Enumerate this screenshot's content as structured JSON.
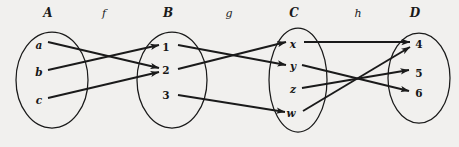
{
  "figure": {
    "background_color": "#f1f0ee",
    "ink_color": "#1a1a1a"
  },
  "sets": [
    {
      "id": "A",
      "label": "A",
      "cx": 52,
      "cy": 80,
      "rx": 36,
      "ry": 48,
      "label_x": 48,
      "label_y": 17,
      "elements": [
        {
          "name": "a",
          "x": 39,
          "y": 45,
          "numeric": false
        },
        {
          "name": "b",
          "x": 39,
          "y": 72,
          "numeric": false
        },
        {
          "name": "c",
          "x": 39,
          "y": 100,
          "numeric": false
        }
      ]
    },
    {
      "id": "B",
      "label": "B",
      "cx": 172,
      "cy": 80,
      "rx": 35,
      "ry": 48,
      "label_x": 168,
      "label_y": 17,
      "elements": [
        {
          "name": "1",
          "x": 166,
          "y": 47,
          "numeric": true
        },
        {
          "name": "2",
          "x": 166,
          "y": 70,
          "numeric": true
        },
        {
          "name": "3",
          "x": 166,
          "y": 95,
          "numeric": true
        }
      ]
    },
    {
      "id": "C",
      "label": "C",
      "cx": 298,
      "cy": 80,
      "rx": 29,
      "ry": 52,
      "label_x": 294,
      "label_y": 17,
      "elements": [
        {
          "name": "x",
          "x": 293,
          "y": 44,
          "numeric": false
        },
        {
          "name": "y",
          "x": 293,
          "y": 66,
          "numeric": false
        },
        {
          "name": "z",
          "x": 293,
          "y": 89,
          "numeric": false
        },
        {
          "name": "w",
          "x": 291,
          "y": 113,
          "numeric": false
        }
      ]
    },
    {
      "id": "D",
      "label": "D",
      "cx": 419,
      "cy": 78,
      "rx": 31,
      "ry": 45,
      "label_x": 415,
      "label_y": 17,
      "elements": [
        {
          "name": "4",
          "x": 419,
          "y": 44,
          "numeric": true
        },
        {
          "name": "5",
          "x": 419,
          "y": 73,
          "numeric": true
        },
        {
          "name": "6",
          "x": 419,
          "y": 93,
          "numeric": true
        }
      ]
    }
  ],
  "maps": [
    {
      "id": "f",
      "label": "f",
      "label_x": 104,
      "label_y": 17,
      "from": "A",
      "to": "B"
    },
    {
      "id": "g",
      "label": "g",
      "label_x": 229,
      "label_y": 17,
      "from": "B",
      "to": "C"
    },
    {
      "id": "h",
      "label": "h",
      "label_x": 358,
      "label_y": 17,
      "from": "C",
      "to": "D"
    }
  ],
  "arrows": [
    {
      "map": "f",
      "from": "a",
      "to": "2",
      "x1": 48,
      "y1": 42,
      "x2": 159,
      "y2": 68
    },
    {
      "map": "f",
      "from": "b",
      "to": "1",
      "x1": 48,
      "y1": 70,
      "x2": 159,
      "y2": 45
    },
    {
      "map": "f",
      "from": "c",
      "to": "2",
      "x1": 48,
      "y1": 98,
      "x2": 159,
      "y2": 72
    },
    {
      "map": "g",
      "from": "1",
      "to": "y",
      "x1": 178,
      "y1": 45,
      "x2": 286,
      "y2": 65
    },
    {
      "map": "g",
      "from": "2",
      "to": "x",
      "x1": 178,
      "y1": 69,
      "x2": 286,
      "y2": 42
    },
    {
      "map": "g",
      "from": "3",
      "to": "w",
      "x1": 178,
      "y1": 95,
      "x2": 285,
      "y2": 112
    },
    {
      "map": "h",
      "from": "x",
      "to": "4",
      "x1": 304,
      "y1": 42,
      "x2": 410,
      "y2": 42
    },
    {
      "map": "h",
      "from": "y",
      "to": "6",
      "x1": 302,
      "y1": 65,
      "x2": 409,
      "y2": 91
    },
    {
      "map": "h",
      "from": "z",
      "to": "5",
      "x1": 302,
      "y1": 88,
      "x2": 409,
      "y2": 70
    },
    {
      "map": "h",
      "from": "w",
      "to": "4",
      "x1": 303,
      "y1": 111,
      "x2": 410,
      "y2": 47
    }
  ]
}
